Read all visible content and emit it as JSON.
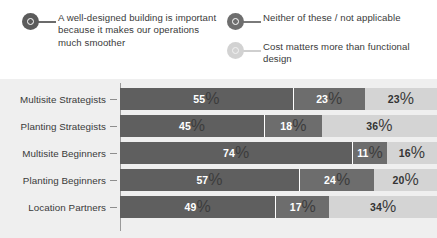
{
  "legend": {
    "entries": [
      {
        "label": "A well-designed building is important because it makes our operations much smoother",
        "color": "#5f5f5f",
        "marker": "donut-marker-icon"
      },
      {
        "label": "Neither of these / not applicable",
        "color": "#6d6d6d",
        "marker": "donut-marker-icon"
      },
      {
        "label": "Cost matters more than functional design",
        "color": "#d4d4d4",
        "marker": "donut-marker-icon"
      }
    ]
  },
  "chart_data": {
    "type": "bar",
    "orientation": "horizontal",
    "stacked": true,
    "normalized": true,
    "title": "",
    "subtitle": "",
    "xlabel": "",
    "ylabel": "",
    "xlim": [
      0,
      100
    ],
    "grid": false,
    "legend_position": "top",
    "value_suffix": "%",
    "categories": [
      "Multisite Strategists",
      "Planting Strategists",
      "Multisite Beginners",
      "Planting Beginners",
      "Location Partners"
    ],
    "series": [
      {
        "name": "A well-designed building is important because it makes our operations much smoother",
        "color": "#5f5f5f",
        "values": [
          55,
          45,
          74,
          57,
          49
        ]
      },
      {
        "name": "Neither of these / not applicable",
        "color": "#6d6d6d",
        "values": [
          23,
          18,
          11,
          24,
          17
        ]
      },
      {
        "name": "Cost matters more than functional design",
        "color": "#d4d4d4",
        "values": [
          23,
          36,
          16,
          20,
          34
        ]
      }
    ],
    "rows": [
      {
        "category": "Multisite Strategists",
        "segments": [
          {
            "value": 55,
            "label": "55",
            "suffix": "%"
          },
          {
            "value": 23,
            "label": "23",
            "suffix": "%"
          },
          {
            "value": 23,
            "label": "23",
            "suffix": "%"
          }
        ]
      },
      {
        "category": "Planting Strategists",
        "segments": [
          {
            "value": 45,
            "label": "45",
            "suffix": "%"
          },
          {
            "value": 18,
            "label": "18",
            "suffix": "%"
          },
          {
            "value": 36,
            "label": "36",
            "suffix": "%"
          }
        ]
      },
      {
        "category": "Multisite Beginners",
        "segments": [
          {
            "value": 74,
            "label": "74",
            "suffix": "%"
          },
          {
            "value": 11,
            "label": "11",
            "suffix": "%"
          },
          {
            "value": 16,
            "label": "16",
            "suffix": "%"
          }
        ]
      },
      {
        "category": "Planting Beginners",
        "segments": [
          {
            "value": 57,
            "label": "57",
            "suffix": "%"
          },
          {
            "value": 24,
            "label": "24",
            "suffix": "%"
          },
          {
            "value": 20,
            "label": "20",
            "suffix": "%"
          }
        ]
      },
      {
        "category": "Location Partners",
        "segments": [
          {
            "value": 49,
            "label": "49",
            "suffix": "%"
          },
          {
            "value": 17,
            "label": "17",
            "suffix": "%"
          },
          {
            "value": 34,
            "label": "34",
            "suffix": "%"
          }
        ]
      }
    ]
  },
  "colors": {
    "panel_background": "#efefef",
    "page_background": "#ffffff",
    "series_1": "#5f5f5f",
    "series_2": "#6d6d6d",
    "series_3": "#d4d4d4",
    "axis": "#9a9a9a",
    "text": "#3a3a3a"
  }
}
